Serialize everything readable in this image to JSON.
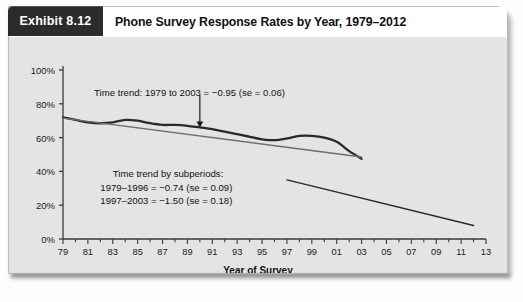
{
  "exhibit": {
    "badge_label": "Exhibit 8.12",
    "title": "Phone Survey Response Rates by Year, 1979–2012"
  },
  "chart_data": {
    "type": "line",
    "title": "Phone Survey Response Rates by Year, 1979–2012",
    "xlabel": "Year of Survey",
    "ylabel": "",
    "xlim": [
      1979,
      2013
    ],
    "ylim": [
      0,
      100
    ],
    "grid": false,
    "legend": "none",
    "y_ticks": [
      "0%",
      "20%",
      "40%",
      "60%",
      "80%",
      "100%"
    ],
    "y_tick_values": [
      0,
      20,
      40,
      60,
      80,
      100
    ],
    "x_ticks": [
      "79",
      "81",
      "83",
      "85",
      "87",
      "89",
      "91",
      "93",
      "95",
      "97",
      "99",
      "01",
      "03",
      "05",
      "07",
      "09",
      "11",
      "13"
    ],
    "x_tick_values": [
      1979,
      1981,
      1983,
      1985,
      1987,
      1989,
      1991,
      1993,
      1995,
      1997,
      1999,
      2001,
      2003,
      2005,
      2007,
      2009,
      2011,
      2013
    ],
    "series": [
      {
        "name": "Observed response rate",
        "style": "wavy-thick",
        "color": "#2a2a2a",
        "x": [
          1979,
          1980,
          1981,
          1982,
          1983,
          1984,
          1985,
          1986,
          1987,
          1988,
          1989,
          1990,
          1991,
          1992,
          1993,
          1994,
          1995,
          1996,
          1997,
          1998,
          1999,
          2000,
          2001,
          2002,
          2003
        ],
        "values": [
          72,
          70.5,
          69,
          68.5,
          69,
          70.5,
          70,
          68.5,
          67.5,
          67.5,
          67,
          66,
          65,
          63.5,
          62,
          60.5,
          59,
          58.5,
          59.5,
          61,
          61,
          60,
          57.5,
          52,
          47.5
        ]
      },
      {
        "name": "Time trend 1979–2003 (fitted)",
        "style": "thin-straight",
        "color": "#6e6e6e",
        "x": [
          1979,
          2003
        ],
        "values": [
          71.5,
          48.5
        ]
      },
      {
        "name": "Time trend 1997–2012 (steep segment)",
        "style": "thin-straight",
        "color": "#2a2a2a",
        "x": [
          1997,
          2012
        ],
        "values": [
          35,
          8
        ]
      }
    ],
    "annotations": [
      {
        "name": "trend-overall",
        "text": "Time trend: 1979 to 2003 = −0.95 (se = 0.06)",
        "x": 1981.5,
        "y": 90
      },
      {
        "name": "subperiods-heading",
        "text": "Time trend by subperiods:",
        "x": 1983,
        "y": 42
      },
      {
        "name": "subperiod-1",
        "text": "1979–1996 = −0.74 (se = 0.09)",
        "x": 1982,
        "y": 34
      },
      {
        "name": "subperiod-2",
        "text": "1997–2003 = −1.50 (se = 0.18)",
        "x": 1982,
        "y": 26
      }
    ],
    "arrow": {
      "x": 1990,
      "y_from": 85,
      "y_to": 66
    }
  },
  "colors": {
    "badge_bg": "#2b2b2b",
    "plot_bg": "#e4e4e4",
    "series_main": "#2a2a2a",
    "series_trend": "#6e6e6e",
    "axis": "#3a3a3a"
  }
}
